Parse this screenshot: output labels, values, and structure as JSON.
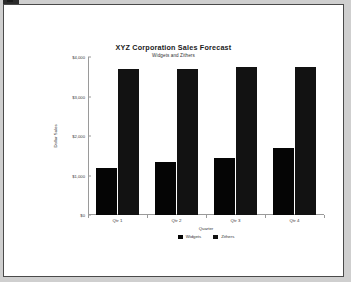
{
  "window": {
    "artifact_icon": "document-marker-icon"
  },
  "chart_data": {
    "type": "bar",
    "title": "XYZ Corporation Sales Forecast",
    "subtitle": "Widgets and Zithers",
    "xlabel": "Quarter",
    "ylabel": "Dollar Sales",
    "categories": [
      "Qtr 1",
      "Qtr 2",
      "Qtr 3",
      "Qtr 4"
    ],
    "series": [
      {
        "name": "Widgets",
        "color": "#050505",
        "values": [
          1200,
          1350,
          1450,
          1700
        ]
      },
      {
        "name": "Zithers",
        "color": "#121212",
        "values": [
          3700,
          3700,
          3750,
          3750
        ]
      }
    ],
    "ylim": [
      0,
      4000
    ],
    "yticks": [
      0,
      1000,
      2000,
      3000,
      4000
    ],
    "ytick_labels": [
      "$0",
      "$1,000",
      "$2,000",
      "$3,000",
      "$4,000"
    ],
    "grid": false,
    "legend_position": "bottom-center"
  }
}
